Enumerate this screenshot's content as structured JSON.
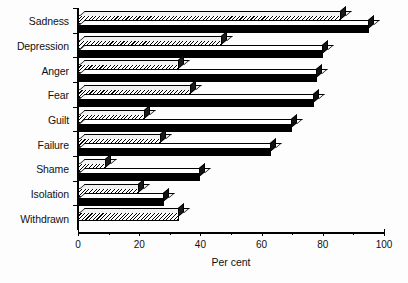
{
  "chart_data": {
    "type": "bar",
    "orientation": "horizontal",
    "title": "",
    "xlabel": "Per cent",
    "ylabel": "",
    "xlim": [
      0,
      100
    ],
    "xticks": [
      0,
      20,
      40,
      60,
      80,
      100
    ],
    "xtick_labels": [
      "0",
      "20",
      "40",
      "60",
      "80",
      "100"
    ],
    "minor_tick_interval": 10,
    "grid": false,
    "legend": false,
    "legend_position": "none",
    "categories": [
      "Sadness",
      "Depression",
      "Anger",
      "Fear",
      "Guilt",
      "Failure",
      "Shame",
      "Isolation",
      "Withdrawn"
    ],
    "series": [
      {
        "name": "series-hatched",
        "pattern": "diagonal-hatch",
        "color": "#ffffff",
        "values": [
          86,
          47,
          33,
          37,
          22,
          27,
          9,
          20,
          33
        ]
      },
      {
        "name": "series-solid",
        "pattern": "solid",
        "color": "#000000",
        "values": [
          95,
          80,
          78,
          77,
          70,
          63,
          40,
          28,
          0
        ]
      }
    ]
  },
  "axis": {
    "x_title": "Per cent"
  }
}
